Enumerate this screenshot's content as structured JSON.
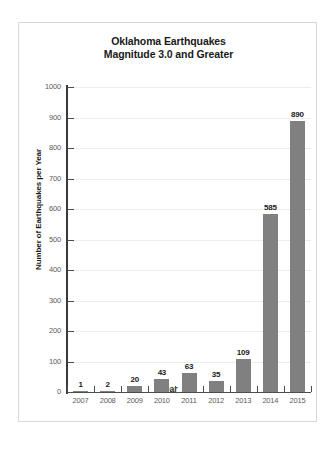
{
  "chart_data": {
    "type": "bar",
    "title": "Oklahoma Earthquakes Magnitude 3.0 and Greater",
    "title_lines": [
      "Oklahoma Earthquakes",
      "Magnitude 3.0 and Greater"
    ],
    "xlabel": "Year",
    "ylabel": "Number of Earthquakes per Year",
    "categories": [
      "2007",
      "2008",
      "2009",
      "2010",
      "2011",
      "2012",
      "2013",
      "2014",
      "2015"
    ],
    "values": [
      1,
      2,
      20,
      43,
      63,
      35,
      109,
      585,
      890
    ],
    "value_labels": [
      "1",
      "2",
      "20",
      "43",
      "63",
      "35",
      "109",
      "585",
      "890"
    ],
    "ylim": [
      0,
      1000
    ],
    "ytick_labels": [
      "0",
      "100",
      "200",
      "300",
      "400",
      "500",
      "600",
      "700",
      "800",
      "900",
      "1000"
    ],
    "ytick_values": [
      0,
      100,
      200,
      300,
      400,
      500,
      600,
      700,
      800,
      900,
      1000
    ],
    "grid": "horizontal",
    "legend": "none",
    "bar_color": "#808080",
    "grid_color": "#ededed",
    "axis_color": "#3a3a3a",
    "text_color": "#1a1a1a",
    "tick_label_color": "#5a5a5a",
    "frame_color": "#d8d8d8",
    "background": "#ffffff"
  }
}
